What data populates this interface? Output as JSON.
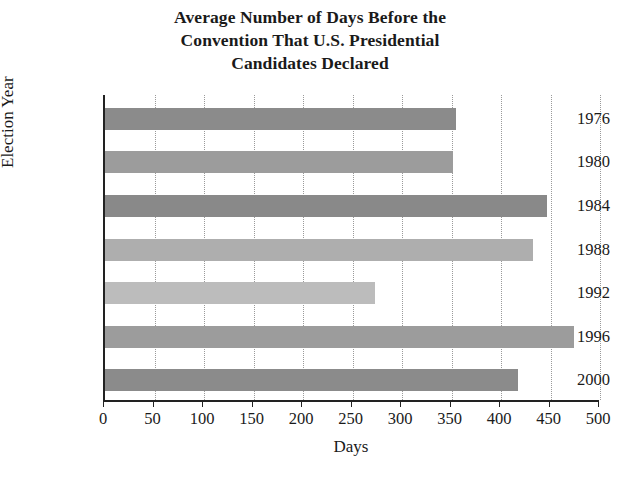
{
  "chart_data": {
    "type": "bar",
    "orientation": "horizontal",
    "title": "Average Number of Days Before the Convention That U.S. Presidential Candidates Declared",
    "title_lines": [
      "Average Number of Days Before the",
      "Convention That U.S. Presidential",
      "Candidates Declared"
    ],
    "xlabel": "Days",
    "ylabel": "Election Year",
    "categories": [
      "1976",
      "1980",
      "1984",
      "1988",
      "1992",
      "1996",
      "2000"
    ],
    "values": [
      355,
      352,
      446,
      432,
      273,
      474,
      417
    ],
    "bar_colors": [
      "#8b8b8b",
      "#9c9c9c",
      "#898989",
      "#aeaeae",
      "#bcbcbc",
      "#9c9c9c",
      "#8b8b8b"
    ],
    "xlim": [
      0,
      500
    ],
    "xticks": [
      0,
      50,
      100,
      150,
      200,
      250,
      300,
      350,
      400,
      450,
      500
    ],
    "xtick_labels": [
      "0",
      "50",
      "100",
      "150",
      "200",
      "250",
      "300",
      "350",
      "400",
      "450",
      "500"
    ],
    "grid": "vertical-dotted",
    "legend": "none",
    "series": [
      {
        "name": "Average days before convention",
        "points": [
          {
            "year": "1976",
            "days": 355
          },
          {
            "year": "1980",
            "days": 352
          },
          {
            "year": "1984",
            "days": 446
          },
          {
            "year": "1988",
            "days": 432
          },
          {
            "year": "1992",
            "days": 273
          },
          {
            "year": "1996",
            "days": 474
          },
          {
            "year": "2000",
            "days": 417
          }
        ]
      }
    ]
  }
}
